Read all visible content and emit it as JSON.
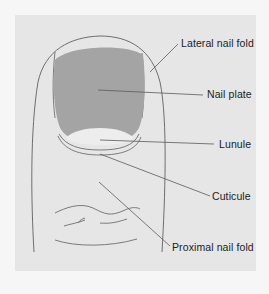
{
  "diagram": {
    "colors": {
      "page_background": "#f6f6f6",
      "panel_background": "#e6e6e6",
      "nail_plate": "#a4a4a4",
      "lunule": "#ededed",
      "outline": "#6e6e6e",
      "leader_line": "#5a5a5a",
      "label_text": "#222222"
    },
    "labels": [
      {
        "id": "lateral-nail-fold",
        "text": "Lateral nail fold"
      },
      {
        "id": "nail-plate",
        "text": "Nail plate"
      },
      {
        "id": "lunule",
        "text": "Lunule"
      },
      {
        "id": "cuticule",
        "text": "Cuticule"
      },
      {
        "id": "proximal-nail-fold",
        "text": "Proximal nail fold"
      }
    ]
  }
}
